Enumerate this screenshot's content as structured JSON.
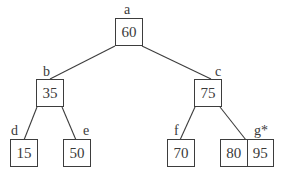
{
  "diagram": {
    "type": "tree",
    "nodes": [
      {
        "id": "a",
        "label": "a",
        "keys": [
          "60"
        ],
        "parent": null
      },
      {
        "id": "b",
        "label": "b",
        "keys": [
          "35"
        ],
        "parent": "a"
      },
      {
        "id": "c",
        "label": "c",
        "keys": [
          "75"
        ],
        "parent": "a"
      },
      {
        "id": "d",
        "label": "d",
        "keys": [
          "15"
        ],
        "parent": "b"
      },
      {
        "id": "e",
        "label": "e",
        "keys": [
          "50"
        ],
        "parent": "b"
      },
      {
        "id": "f",
        "label": "f",
        "keys": [
          "70"
        ],
        "parent": "c"
      },
      {
        "id": "g",
        "label": "g*",
        "keys": [
          "80",
          "95"
        ],
        "parent": "c"
      }
    ],
    "edges": [
      {
        "from": "a",
        "to": "b"
      },
      {
        "from": "a",
        "to": "c"
      },
      {
        "from": "b",
        "to": "d"
      },
      {
        "from": "b",
        "to": "e"
      },
      {
        "from": "c",
        "to": "f"
      },
      {
        "from": "c",
        "to": "g"
      }
    ]
  },
  "colors": {
    "line": "#3d3d3d",
    "text": "#3a3a3a",
    "background": "#ffffff"
  }
}
